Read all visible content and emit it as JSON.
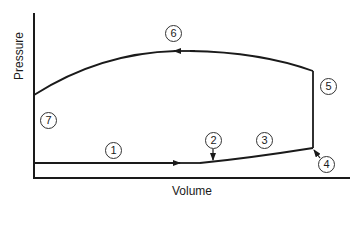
{
  "diagram": {
    "type": "pressure-volume cycle diagram",
    "axes": {
      "x_label": "Volume",
      "y_label": "Pressure"
    },
    "markers": [
      {
        "id": "1",
        "label": "1",
        "position": "on lower horizontal path"
      },
      {
        "id": "2",
        "label": "2",
        "position": "arrow pointing down to lower curve"
      },
      {
        "id": "3",
        "label": "3",
        "position": "above lower rising curve"
      },
      {
        "id": "4",
        "label": "4",
        "position": "arrow pointing at bottom-right corner"
      },
      {
        "id": "5",
        "label": "5",
        "position": "right of vertical segment"
      },
      {
        "id": "6",
        "label": "6",
        "position": "above top curve"
      },
      {
        "id": "7",
        "label": "7",
        "position": "left side near y-axis"
      }
    ],
    "colors": {
      "line": "#1a1a1a",
      "background": "#ffffff"
    }
  }
}
